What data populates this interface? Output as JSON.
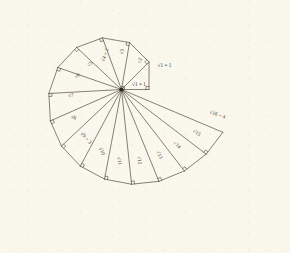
{
  "figure": {
    "kind": "spiral-of-theodorus",
    "ink_color": "#3a352c",
    "paper_color": "#faf8ec",
    "origin": {
      "x": 121.5,
      "y": 89.5
    },
    "unit_length": 27.5,
    "start_angle_deg": 0,
    "triangle_count": 16,
    "right_angle_marks": true
  },
  "labels": [
    {
      "id": "leg-1",
      "text": "√1 = 1",
      "x": 139.0,
      "y": 86.0,
      "rotate": 0,
      "anchor": "middle"
    },
    {
      "id": "hyp-1",
      "text": "√1 = 1",
      "x": 164.5,
      "y": 67.0,
      "rotate": 0,
      "anchor": "middle"
    },
    {
      "id": "hyp-2",
      "text": "√2",
      "x": 141.0,
      "y": 61.0,
      "rotate": -62,
      "anchor": "middle"
    },
    {
      "id": "hyp-3",
      "text": "√3",
      "x": 123.5,
      "y": 52.0,
      "rotate": -76,
      "anchor": "middle"
    },
    {
      "id": "hyp-4",
      "text": "√4 = 2",
      "x": 106.5,
      "y": 55.5,
      "rotate": -72,
      "anchor": "middle"
    },
    {
      "id": "hyp-5",
      "text": "√5",
      "x": 91.0,
      "y": 65.0,
      "rotate": -46,
      "anchor": "middle"
    },
    {
      "id": "hyp-6",
      "text": "√6",
      "x": 78.0,
      "y": 77.0,
      "rotate": -26,
      "anchor": "middle"
    },
    {
      "id": "hyp-7",
      "text": "√7",
      "x": 71.0,
      "y": 97.0,
      "rotate": -2,
      "anchor": "middle"
    },
    {
      "id": "hyp-8",
      "text": "√8",
      "x": 73.0,
      "y": 119.0,
      "rotate": 24,
      "anchor": "middle"
    },
    {
      "id": "hyp-9",
      "text": "√9 = 3",
      "x": 85.0,
      "y": 139.0,
      "rotate": 48,
      "anchor": "middle"
    },
    {
      "id": "hyp-10",
      "text": "√10",
      "x": 100.5,
      "y": 152.0,
      "rotate": 62,
      "anchor": "middle"
    },
    {
      "id": "hyp-11",
      "text": "√11",
      "x": 118.0,
      "y": 161.5,
      "rotate": 77,
      "anchor": "middle"
    },
    {
      "id": "hyp-12",
      "text": "√12",
      "x": 138.0,
      "y": 160.5,
      "rotate": 83,
      "anchor": "middle"
    },
    {
      "id": "hyp-13",
      "text": "√13",
      "x": 158.0,
      "y": 155.5,
      "rotate": 61,
      "anchor": "middle"
    },
    {
      "id": "hyp-14",
      "text": "√14",
      "x": 176.0,
      "y": 146.0,
      "rotate": 44,
      "anchor": "middle"
    },
    {
      "id": "hyp-15",
      "text": "√15",
      "x": 196.0,
      "y": 134.0,
      "rotate": 33,
      "anchor": "middle"
    },
    {
      "id": "hyp-16",
      "text": "√16 = 4",
      "x": 217.0,
      "y": 116.0,
      "rotate": 19,
      "anchor": "middle"
    }
  ],
  "chart_data": {
    "type": "diagram",
    "title": "",
    "hypotenuse_values": [
      {
        "n": 1,
        "label": "√1 = 1",
        "value": 1.0
      },
      {
        "n": 2,
        "label": "√2",
        "value": 1.414
      },
      {
        "n": 3,
        "label": "√3",
        "value": 1.732
      },
      {
        "n": 4,
        "label": "√4 = 2",
        "value": 2.0
      },
      {
        "n": 5,
        "label": "√5",
        "value": 2.236
      },
      {
        "n": 6,
        "label": "√6",
        "value": 2.449
      },
      {
        "n": 7,
        "label": "√7",
        "value": 2.646
      },
      {
        "n": 8,
        "label": "√8",
        "value": 2.828
      },
      {
        "n": 9,
        "label": "√9 = 3",
        "value": 3.0
      },
      {
        "n": 10,
        "label": "√10",
        "value": 3.162
      },
      {
        "n": 11,
        "label": "√11",
        "value": 3.317
      },
      {
        "n": 12,
        "label": "√12",
        "value": 3.464
      },
      {
        "n": 13,
        "label": "√13",
        "value": 3.606
      },
      {
        "n": 14,
        "label": "√14",
        "value": 3.742
      },
      {
        "n": 15,
        "label": "√15",
        "value": 3.873
      },
      {
        "n": 16,
        "label": "√16 = 4",
        "value": 4.0
      }
    ],
    "legs": [
      {
        "id": "base-leg",
        "label": "√1 = 1",
        "value": 1.0
      },
      {
        "id": "vertical-leg",
        "label": "√1 = 1",
        "value": 1.0
      }
    ]
  }
}
